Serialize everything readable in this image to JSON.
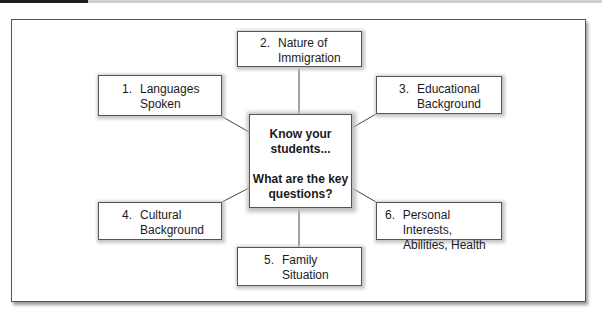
{
  "center": {
    "line1": "Know your",
    "line2": "students...",
    "line3": "What are the key",
    "line4": "questions?"
  },
  "nodes": [
    {
      "num": "1.",
      "line1": "Languages",
      "line2": "Spoken"
    },
    {
      "num": "2.",
      "line1": "Nature of",
      "line2": "Immigration"
    },
    {
      "num": "3.",
      "line1": "Educational",
      "line2": "Background"
    },
    {
      "num": "4.",
      "line1": "Cultural",
      "line2": "Background"
    },
    {
      "num": "5.",
      "line1": "Family",
      "line2": "Situation"
    },
    {
      "num": "6.",
      "line1": "Personal Interests,",
      "line2": "Abilities, Health"
    }
  ],
  "colors": {
    "border": "#555555",
    "header_dark": "#1e1e1e",
    "header_light": "#cfcfcf"
  }
}
